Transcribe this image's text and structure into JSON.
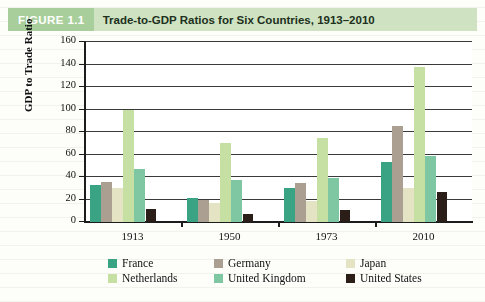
{
  "figure": {
    "tag": "FIGURE 1.1",
    "title": "Trade-to-GDP Ratios for Six Countries, 1913–2010"
  },
  "chart_data": {
    "type": "bar",
    "title": "Trade-to-GDP Ratios for Six Countries, 1913–2010",
    "xlabel": "",
    "ylabel": "GDP to Trade Ratio",
    "categories": [
      "1913",
      "1950",
      "1973",
      "2010"
    ],
    "ylim": [
      0,
      160
    ],
    "yticks": [
      0,
      20,
      40,
      60,
      80,
      100,
      120,
      140,
      160
    ],
    "grid": true,
    "legend_position": "bottom",
    "series": [
      {
        "name": "France",
        "color": "#3aa383",
        "values": [
          33,
          21,
          30,
          53
        ]
      },
      {
        "name": "Germany",
        "color": "#ab9f92",
        "values": [
          36,
          20,
          35,
          85
        ]
      },
      {
        "name": "Japan",
        "color": "#e4e3c4",
        "values": [
          30,
          17,
          19,
          30
        ]
      },
      {
        "name": "Netherlands",
        "color": "#c6e0a4",
        "values": [
          100,
          70,
          75,
          138
        ]
      },
      {
        "name": "United Kingdom",
        "color": "#7fc6a3",
        "values": [
          47,
          37,
          39,
          59
        ]
      },
      {
        "name": "United States",
        "color": "#2b1d17",
        "values": [
          12,
          7,
          11,
          27
        ]
      }
    ]
  }
}
